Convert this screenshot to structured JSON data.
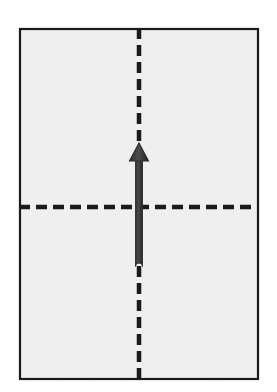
{
  "figure": {
    "caption": "",
    "canvas": {
      "width": 277,
      "height": 392,
      "background": "#ffffff"
    }
  },
  "chart_data": {
    "type": "diagram",
    "elements": [
      {
        "name": "paper-sheet",
        "kind": "rectangle",
        "x": 19,
        "y": 28,
        "width": 240,
        "height": 352,
        "fill": "#f2f2f2",
        "stroke": "#1a1a1a",
        "stroke_width": 2
      },
      {
        "name": "vertical-fold-line",
        "kind": "dashed-line",
        "orientation": "vertical",
        "x1": 139,
        "y1": 28,
        "x2": 139,
        "y2": 380,
        "stroke": "#1a1a1a",
        "stroke_width": 4.5,
        "dash": "11 6"
      },
      {
        "name": "horizontal-fold-line",
        "kind": "dashed-line",
        "orientation": "horizontal",
        "x1": 19,
        "y1": 207,
        "x2": 259,
        "y2": 207,
        "stroke": "#1a1a1a",
        "stroke_width": 4.5,
        "dash": "11 6"
      },
      {
        "name": "fold-direction-arrow",
        "kind": "arrow",
        "direction": "up",
        "tail_x": 139,
        "tail_y": 270,
        "tip_x": 139,
        "tip_y": 143,
        "shaft_width": 7,
        "head_width": 19,
        "head_length": 18,
        "fill": "#3b3b3b",
        "stroke": "#2a2a2a"
      }
    ],
    "colors": {
      "paper_fill": "#f2f2f2",
      "border": "#1a1a1a",
      "fold_line": "#1a1a1a",
      "arrow": "#3b3b3b",
      "background": "#ffffff"
    }
  }
}
